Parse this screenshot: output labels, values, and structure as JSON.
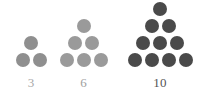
{
  "figure": {
    "name": "triangular-numbers-dot-diagram",
    "background_color": "#ffffff",
    "dot_diameter_px": 14,
    "groups": [
      {
        "label": "3",
        "count": 3,
        "rows": [
          1,
          2
        ],
        "dot_color": "#8f8f8f",
        "label_color": "#a8a8a8"
      },
      {
        "label": "6",
        "count": 6,
        "rows": [
          1,
          2,
          3
        ],
        "dot_color": "#9a9a9a",
        "label_color": "#9e9e9e"
      },
      {
        "label": "10",
        "count": 10,
        "rows": [
          1,
          2,
          3,
          4
        ],
        "dot_color": "#4a4a4a",
        "label_color": "#555555"
      }
    ]
  },
  "chart_data": {
    "type": "bar",
    "title": "",
    "subtitle": "",
    "xlabel": "",
    "ylabel": "",
    "categories": [
      "3",
      "6",
      "10"
    ],
    "values": [
      3,
      6,
      10
    ],
    "series": [
      {
        "name": "Triangular numbers (dot count)",
        "values": [
          3,
          6,
          10
        ]
      },
      {
        "name": "Rows per figure",
        "values": [
          2,
          3,
          4
        ]
      }
    ],
    "annotations": [
      "3",
      "6",
      "10"
    ],
    "legend": [],
    "grid": false,
    "ylim": [
      0,
      10
    ]
  }
}
